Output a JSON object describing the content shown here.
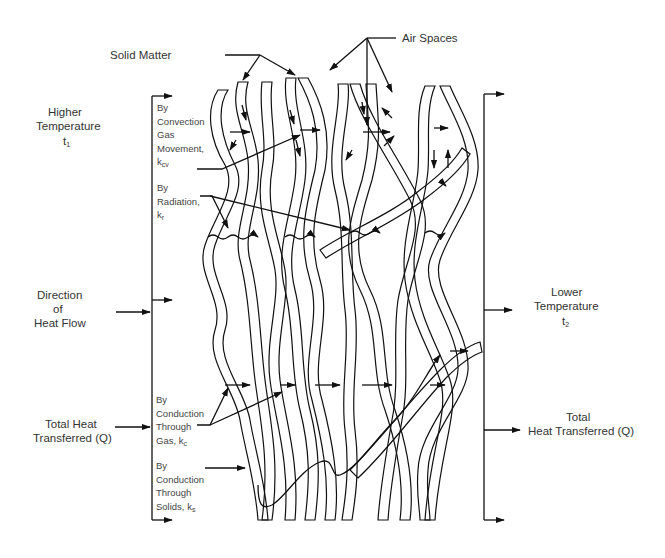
{
  "diagram": {
    "title_labels": {
      "solid_matter": "Solid Matter",
      "air_spaces": "Air Spaces"
    },
    "left_side": {
      "higher_temperature": [
        "Higher",
        "Temperature"
      ],
      "t1": {
        "base": "t",
        "sub": "1"
      },
      "direction": [
        "Direction",
        "of",
        "Heat Flow"
      ],
      "total_heat": [
        "Total Heat",
        "Transferred (Q)"
      ]
    },
    "right_side": {
      "lower_temperature": [
        "Lower",
        "Temperature"
      ],
      "t2": {
        "base": "t",
        "sub": "2"
      },
      "total_heat": [
        "Total",
        "Heat Transferred (Q)"
      ]
    },
    "mechanisms": [
      {
        "lines": [
          "By",
          "Convection",
          "Gas",
          "Movement,"
        ],
        "symbol": "k",
        "sub": "cv"
      },
      {
        "lines": [
          "By",
          "Radiation,"
        ],
        "symbol": "k",
        "sub": "r"
      },
      {
        "lines": [
          "By",
          "Conduction",
          "Through",
          "Gas,"
        ],
        "symbol": "k",
        "sub": "c"
      },
      {
        "lines": [
          "By",
          "Conduction",
          "Through",
          "Solids,"
        ],
        "symbol": "k",
        "sub": "s"
      }
    ],
    "colors": {
      "ink": "#111111",
      "text": "#333333",
      "background": "#ffffff"
    }
  }
}
